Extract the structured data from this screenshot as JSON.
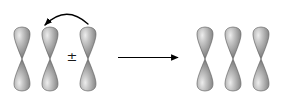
{
  "figure": {
    "background_color": "#ffffff",
    "width": 285,
    "height": 102,
    "operator_symbol": "±",
    "operator_position": {
      "x": 72,
      "y": 57
    },
    "reaction_arrow": {
      "name": "yields-arrow",
      "direction": "right",
      "color": "#000000",
      "x1": 118,
      "x2": 178,
      "y": 57.5
    },
    "curved_arrow": {
      "name": "orbital-transfer-arrow",
      "direction": "right-to-left",
      "color": "#000000",
      "start": {
        "x": 88,
        "y": 24
      },
      "control": {
        "x": 66,
        "y": 4
      },
      "end": {
        "x": 45,
        "y": 25
      }
    },
    "orbital_style": {
      "lobe_light": "#e8e8e8",
      "lobe_mid": "#9a9a9a",
      "lobe_dark": "#6e6e6e",
      "outline": "#5a5a5a",
      "half_width": 13,
      "half_height": 32,
      "center_y": 59
    },
    "groups": [
      {
        "name": "reactant-orbital-group-left",
        "label": "bonded p-orbital pair",
        "orbitals": [
          {
            "name": "p-orbital-1",
            "cx": 22
          },
          {
            "name": "p-orbital-2",
            "cx": 50
          }
        ]
      },
      {
        "name": "reactant-orbital-group-right",
        "label": "incoming p-orbital",
        "orbitals": [
          {
            "name": "p-orbital-3",
            "cx": 88
          }
        ]
      },
      {
        "name": "product-orbital-group",
        "label": "delocalized three p-orbital system",
        "orbitals": [
          {
            "name": "p-orbital-4",
            "cx": 205
          },
          {
            "name": "p-orbital-5",
            "cx": 233
          },
          {
            "name": "p-orbital-6",
            "cx": 261
          }
        ]
      }
    ]
  }
}
